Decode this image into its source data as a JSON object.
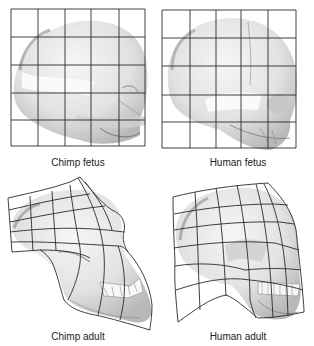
{
  "figure": {
    "panels": [
      {
        "id": "chimp-fetus",
        "label": "Chimp fetus",
        "grid": "regular 5x5 square grid"
      },
      {
        "id": "human-fetus",
        "label": "Human fetus",
        "grid": "regular 5x5 square grid"
      },
      {
        "id": "chimp-adult",
        "label": "Chimp adult",
        "grid": "deformed grid, stretched forward and downward at face/jaw"
      },
      {
        "id": "human-adult",
        "label": "Human adult",
        "grid": "mildly deformed grid"
      }
    ],
    "colors": {
      "grid_line": "#2a2a2a",
      "skull_light": "#ececec",
      "skull_mid": "#cfcfcf",
      "skull_shadow": "#9a9a9a",
      "label_text": "#222222",
      "background": "#ffffff"
    }
  }
}
